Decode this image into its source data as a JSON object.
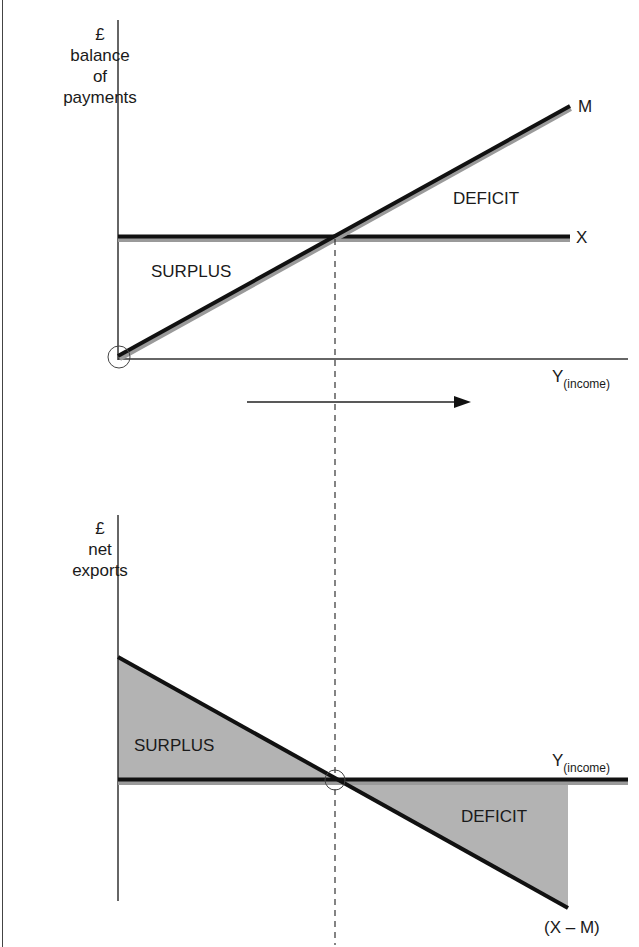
{
  "top_chart": {
    "y_axis_label": {
      "line1": "£",
      "line2": "balance",
      "line3": "of",
      "line4": "payments"
    },
    "x_axis_label": {
      "main": "Y",
      "sub": "(income)"
    },
    "lines": [
      {
        "name": "M",
        "label": "M",
        "from": [
          118,
          357
        ],
        "to": [
          570,
          107
        ],
        "meaning": "imports rising with income"
      },
      {
        "name": "X",
        "label": "X",
        "from": [
          118,
          237
        ],
        "to": [
          570,
          237
        ],
        "meaning": "exports constant"
      }
    ],
    "regions": {
      "surplus": "SURPLUS",
      "deficit": "DEFICIT"
    },
    "origin_marker": "circle"
  },
  "direction_arrow": {
    "direction": "right",
    "meaning": "increasing income"
  },
  "bottom_chart": {
    "y_axis_label": {
      "line1": "£",
      "line2": "net",
      "line3": "exports"
    },
    "x_axis_label": {
      "main": "Y",
      "sub": "(income)"
    },
    "line_label": "(X – M)",
    "regions": {
      "surplus": "SURPLUS",
      "deficit": "DEFICIT"
    },
    "fill_color": "#b3b3b3",
    "intersection_marker": "circle"
  },
  "guide": {
    "type": "dashed-vertical",
    "x": 335
  },
  "colors": {
    "line": "#111111",
    "shadow": "#9a9a9a",
    "fill": "#b3b3b3",
    "axis": "#333333"
  }
}
